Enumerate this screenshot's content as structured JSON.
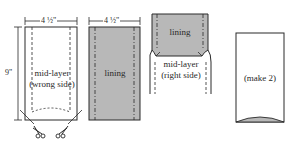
{
  "figure": {
    "panel1": {
      "width_label": "4 ½\"",
      "height_label": "9\"",
      "label_line1": "mid-layer",
      "label_line2": "(wrong side)"
    },
    "panel2": {
      "width_label": "4 ½\"",
      "label": "lining"
    },
    "panel3": {
      "lining_label": "lining",
      "label_line1": "mid-layer",
      "label_line2": "(right side)"
    },
    "panel4": {
      "label": "(make 2)"
    },
    "icons": [
      "scissors-icon",
      "scissors-icon"
    ],
    "colors": {
      "line": "#2a2a2a",
      "lining_fill": "#b8b8b8",
      "background": "#ffffff"
    }
  }
}
